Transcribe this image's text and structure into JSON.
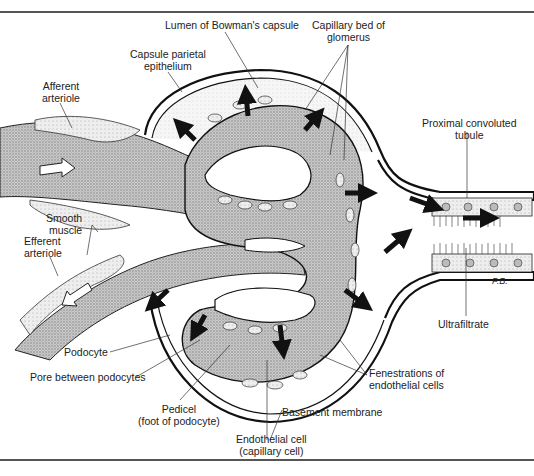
{
  "figure": {
    "signature": "P.B."
  },
  "labels": {
    "lumen_bowmans": "Lumen of Bowman's capsule",
    "capillary_bed_1": "Capillary bed of",
    "capillary_bed_2": "glomerus",
    "capsule_parietal_1": "Capsule parietal",
    "capsule_parietal_2": "epithelium",
    "afferent_1": "Afferent",
    "afferent_2": "arteriole",
    "proximal_1": "Proximal convoluted",
    "proximal_2": "tubule",
    "smooth_1": "Smooth",
    "smooth_2": "muscle",
    "efferent_1": "Efferent",
    "efferent_2": "arteriole",
    "ultrafiltrate": "Ultrafiltrate",
    "podocyte": "Podocyte",
    "pore": "Pore between podocytes",
    "fenestrations_1": "Fenestrations of",
    "fenestrations_2": "endothelial cells",
    "pedicel_1": "Pedicel",
    "pedicel_2": "(foot of podocyte)",
    "basement": "Basement membrane",
    "endothelial_1": "Endothelial cell",
    "endothelial_2": "(capillary cell)"
  },
  "colors": {
    "ink": "#1a1a1a",
    "stipple": "#b5b5b5",
    "cell_fill": "#e4e4e4",
    "background": "#ffffff"
  }
}
